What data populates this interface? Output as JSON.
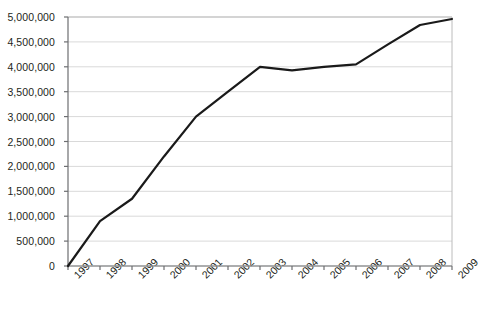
{
  "chart_data": {
    "type": "line",
    "title": "",
    "subtitle": "",
    "xlabel": "",
    "ylabel": "",
    "categories": [
      "1997",
      "1998",
      "1999",
      "2000",
      "2001",
      "2002",
      "2003",
      "2004",
      "2005",
      "2006",
      "2007",
      "2008",
      "2009"
    ],
    "x": [
      1997,
      1998,
      1999,
      2000,
      2001,
      2002,
      2003,
      2004,
      2005,
      2006,
      2007,
      2008,
      2009
    ],
    "series": [
      {
        "name": "",
        "values": [
          0,
          900000,
          1350000,
          2200000,
          3000000,
          3500000,
          4000000,
          3930000,
          4000000,
          4050000,
          4450000,
          4840000,
          4960000
        ]
      }
    ],
    "ylim": [
      0,
      5000000
    ],
    "xlim": [
      1997,
      2009
    ],
    "y_ticks": [
      0,
      500000,
      1000000,
      1500000,
      2000000,
      2500000,
      3000000,
      3500000,
      4000000,
      4500000,
      5000000
    ],
    "y_tick_labels": [
      "0",
      "500,000",
      "1,000,000",
      "1,500,000",
      "2,000,000",
      "2,500,000",
      "3,000,000",
      "3,500,000",
      "4,000,000",
      "4,500,000",
      "5,000,000"
    ],
    "grid": {
      "horizontal": true,
      "vertical": false
    },
    "legend": {
      "visible": false,
      "position": "none"
    },
    "colors": {
      "line": "#1a1a1a",
      "grid": "#d9d9d9",
      "axis": "#6d6e71",
      "border": "#bcbcbc",
      "text": "#231f20",
      "background": "#ffffff"
    },
    "line_width": 2.2,
    "markers": false,
    "x_label_rotation": -45
  },
  "plot_area": {
    "left": 68,
    "right": 452,
    "top": 17,
    "bottom": 266
  }
}
